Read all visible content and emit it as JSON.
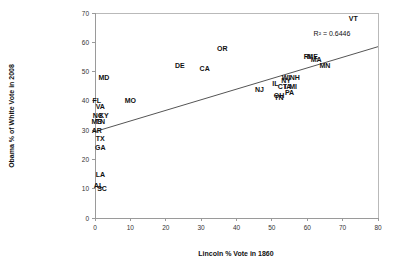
{
  "chart_data": {
    "type": "scatter",
    "title": "",
    "xlabel": "Lincoln % Vote in 1860",
    "ylabel": "Obama % of White Vote in 2008",
    "xlim": [
      0,
      80
    ],
    "ylim": [
      0,
      70
    ],
    "xticks": [
      "0",
      "10",
      "20",
      "30",
      "40",
      "50",
      "60",
      "70",
      "80"
    ],
    "yticks": [
      "0",
      "10",
      "20",
      "30",
      "40",
      "50",
      "60",
      "70"
    ],
    "grid": false,
    "legend": "none",
    "annotation": "R² = 0.6446",
    "marker_style": "text-label",
    "trendline": {
      "visible": true,
      "x_start": 0,
      "y_start": 29.5,
      "x_end": 80,
      "y_end": 58.5
    },
    "points": [
      {
        "label": "MD",
        "x": 2.5,
        "y": 48
      },
      {
        "label": "FL",
        "x": 0.5,
        "y": 40
      },
      {
        "label": "MO",
        "x": 10,
        "y": 40
      },
      {
        "label": "VA",
        "x": 1.5,
        "y": 38
      },
      {
        "label": "NC",
        "x": 0.8,
        "y": 35
      },
      {
        "label": "KY",
        "x": 2.5,
        "y": 35
      },
      {
        "label": "MS",
        "x": 0.5,
        "y": 33
      },
      {
        "label": "TN",
        "x": 1.5,
        "y": 33
      },
      {
        "label": "AR",
        "x": 0.5,
        "y": 30
      },
      {
        "label": "TX",
        "x": 1.5,
        "y": 27
      },
      {
        "label": "GA",
        "x": 1.5,
        "y": 24
      },
      {
        "label": "LA",
        "x": 1.5,
        "y": 15
      },
      {
        "label": "AL",
        "x": 1.0,
        "y": 11
      },
      {
        "label": "SC",
        "x": 2.0,
        "y": 10
      },
      {
        "label": "DE",
        "x": 24,
        "y": 52
      },
      {
        "label": "CA",
        "x": 31,
        "y": 51
      },
      {
        "label": "OR",
        "x": 36,
        "y": 58
      },
      {
        "label": "NJ",
        "x": 46.5,
        "y": 44
      },
      {
        "label": "IL",
        "x": 51,
        "y": 46
      },
      {
        "label": "OH",
        "x": 52,
        "y": 42
      },
      {
        "label": "TN",
        "x": 52,
        "y": 41
      },
      {
        "label": "NY",
        "x": 54,
        "y": 47
      },
      {
        "label": "CT",
        "x": 53,
        "y": 45
      },
      {
        "label": "IA",
        "x": 54.5,
        "y": 45
      },
      {
        "label": "MI",
        "x": 56,
        "y": 45
      },
      {
        "label": "PA",
        "x": 55,
        "y": 43
      },
      {
        "label": "WI",
        "x": 54,
        "y": 48
      },
      {
        "label": "NH",
        "x": 56.5,
        "y": 48
      },
      {
        "label": "RI",
        "x": 60,
        "y": 55
      },
      {
        "label": "ME",
        "x": 61.5,
        "y": 55
      },
      {
        "label": "MA",
        "x": 62.5,
        "y": 54
      },
      {
        "label": "MN",
        "x": 65,
        "y": 52
      },
      {
        "label": "VT",
        "x": 73,
        "y": 68
      }
    ]
  }
}
